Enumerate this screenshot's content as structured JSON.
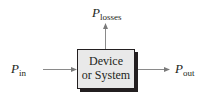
{
  "diagram": {
    "type": "power-flow-block-diagram",
    "block": {
      "line1": "Device",
      "line2": "or System"
    },
    "input": {
      "symbol": "P",
      "subscript": "in"
    },
    "output": {
      "symbol": "P",
      "subscript": "out"
    },
    "losses": {
      "symbol": "P",
      "subscript": "losses"
    },
    "colors": {
      "line": "#8a8a8a",
      "box_fill": "#e9e9e9",
      "text": "#231f20"
    }
  }
}
